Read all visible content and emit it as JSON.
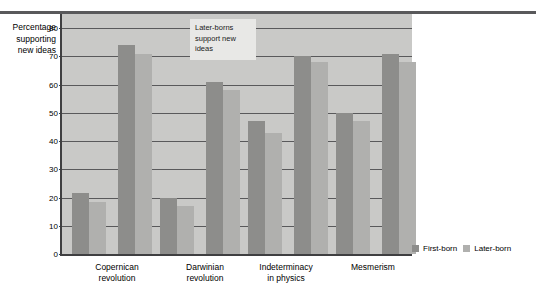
{
  "chart_data": {
    "type": "bar",
    "title": "",
    "xlabel": "",
    "ylabel": "Percentage supporting new ideas",
    "ylabel_lines": [
      "Percentage",
      "supporting",
      "new ideas"
    ],
    "ylim": [
      0,
      85
    ],
    "yticks": [
      0,
      10,
      20,
      30,
      40,
      50,
      60,
      70,
      80
    ],
    "grid": true,
    "legend_position": "bottom-right",
    "categories": [
      "Copernican revolution",
      "Darwinian revolution",
      "Indeterminacy in physics",
      "Mesmerism"
    ],
    "category_lines": [
      [
        "Copernican",
        "revolution"
      ],
      [
        "Darwinian",
        "revolution"
      ],
      [
        "Indeterminacy",
        "in physics"
      ],
      [
        "Mesmerism"
      ]
    ],
    "series": [
      {
        "name": "First-born",
        "color": "#8d8d8b",
        "values": [
          21.5,
          20,
          47,
          50
        ]
      },
      {
        "name": "Later-born",
        "color": "#b0b0ae",
        "values": [
          18.5,
          17,
          43,
          47
        ]
      }
    ],
    "secondary_series": [
      {
        "name": "First-born",
        "color": "#8d8d8b",
        "values": [
          74,
          61,
          70,
          71
        ]
      },
      {
        "name": "Later-born",
        "color": "#b0b0ae",
        "values": [
          71,
          58,
          68,
          68
        ]
      }
    ],
    "annotations": [
      {
        "text": "Later-borns support new ideas",
        "lines": [
          "Later-borns",
          "support new",
          "ideas"
        ]
      }
    ]
  },
  "colors": {
    "plot_background": "#c9c9c7",
    "axis": "#3f3f41",
    "gridline": "#59595b",
    "first_born": "#8d8d8b",
    "later_born": "#b0b0ae",
    "annotation_background": "#e8e8e6",
    "rule": "#59595b"
  }
}
